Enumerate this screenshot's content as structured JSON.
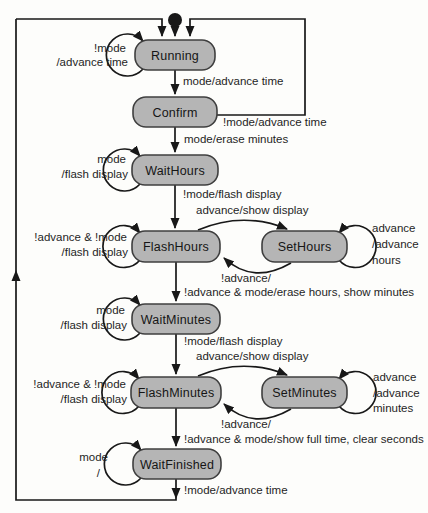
{
  "diagram": {
    "kind": "state-machine",
    "colors": {
      "background": "#fdfdfb",
      "state_fill": "#b5b5b5",
      "state_border": "#3f3f3f",
      "state_text": "#161616",
      "line": "#181818",
      "text": "#1f1f1f"
    },
    "states": [
      {
        "name": "Running"
      },
      {
        "name": "Confirm"
      },
      {
        "name": "WaitHours"
      },
      {
        "name": "FlashHours"
      },
      {
        "name": "SetHours"
      },
      {
        "name": "WaitMinutes"
      },
      {
        "name": "FlashMinutes"
      },
      {
        "name": "SetMinutes"
      },
      {
        "name": "WaitFinished"
      }
    ],
    "initial_state": {
      "to": "Running"
    },
    "transitions": [
      {
        "from": "initial",
        "to": "Running",
        "lines": []
      },
      {
        "from": "Running",
        "to": "Running",
        "lines": [
          "!mode",
          "/advance time"
        ]
      },
      {
        "from": "Running",
        "to": "Confirm",
        "lines": [
          "mode/advance time"
        ]
      },
      {
        "from": "Confirm",
        "to": "Running",
        "lines": [
          "!mode/advance time"
        ]
      },
      {
        "from": "Confirm",
        "to": "WaitHours",
        "lines": [
          "mode/erase minutes"
        ]
      },
      {
        "from": "WaitHours",
        "to": "WaitHours",
        "lines": [
          "mode",
          "/flash display"
        ]
      },
      {
        "from": "WaitHours",
        "to": "FlashHours",
        "lines": [
          "!mode/flash display"
        ]
      },
      {
        "from": "FlashHours",
        "to": "SetHours",
        "lines": [
          "advance/show display"
        ]
      },
      {
        "from": "FlashHours",
        "to": "FlashHours",
        "lines": [
          "!advance & !mode",
          "/flash display"
        ]
      },
      {
        "from": "SetHours",
        "to": "SetHours",
        "lines": [
          "advance",
          "/advance",
          "hours"
        ]
      },
      {
        "from": "SetHours",
        "to": "FlashHours",
        "lines": [
          "!advance/"
        ]
      },
      {
        "from": "FlashHours",
        "to": "WaitMinutes",
        "lines": [
          "!advance & mode/erase hours, show minutes"
        ]
      },
      {
        "from": "WaitMinutes",
        "to": "WaitMinutes",
        "lines": [
          "mode",
          "/flash display"
        ]
      },
      {
        "from": "WaitMinutes",
        "to": "FlashMinutes",
        "lines": [
          "!mode/flash display"
        ]
      },
      {
        "from": "FlashMinutes",
        "to": "SetMinutes",
        "lines": [
          "advance/show display"
        ]
      },
      {
        "from": "FlashMinutes",
        "to": "FlashMinutes",
        "lines": [
          "!advance & !mode",
          "/flash display"
        ]
      },
      {
        "from": "SetMinutes",
        "to": "SetMinutes",
        "lines": [
          "advance",
          "/advance",
          "minutes"
        ]
      },
      {
        "from": "SetMinutes",
        "to": "FlashMinutes",
        "lines": [
          "!advance/"
        ]
      },
      {
        "from": "FlashMinutes",
        "to": "WaitFinished",
        "lines": [
          "!advance & mode/show full time, clear seconds"
        ]
      },
      {
        "from": "WaitFinished",
        "to": "WaitFinished",
        "lines": [
          "mode",
          "/"
        ]
      },
      {
        "from": "WaitFinished",
        "to": "Running",
        "lines": [
          "!mode/advance time"
        ]
      }
    ]
  }
}
